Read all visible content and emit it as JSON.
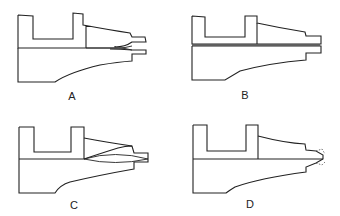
{
  "figure": {
    "panels": [
      {
        "id": "A",
        "label": "A",
        "description": "Two-jaw tip with flared divergent channel opening"
      },
      {
        "id": "B",
        "label": "B",
        "description": "Two-jaw tip with straight narrow slit"
      },
      {
        "id": "C",
        "label": "C",
        "description": "Tip with lens-shaped (convex) internal cavity"
      },
      {
        "id": "D",
        "label": "D",
        "description": "Tip with pointed nozzle and dashed (eroded) outline"
      }
    ]
  }
}
